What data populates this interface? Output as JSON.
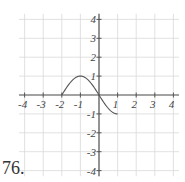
{
  "problem": {
    "number_label": "76."
  },
  "chart_data": {
    "type": "line",
    "title": "",
    "xlabel": "",
    "ylabel": "",
    "xlim": [
      -4,
      4
    ],
    "ylim": [
      -4,
      4
    ],
    "grid": true,
    "x_ticks": [
      -4,
      -3,
      -2,
      -1,
      1,
      2,
      3,
      4
    ],
    "y_ticks": [
      4,
      3,
      2,
      1,
      -1,
      -2,
      -3,
      -4
    ],
    "x_tick_labels": [
      "-4",
      "-3",
      "-2",
      "-1",
      "1",
      "2",
      "3",
      "4"
    ],
    "y_tick_labels": [
      "4",
      "3",
      "2",
      "1",
      "-1",
      "-2",
      "-3",
      "-4"
    ],
    "series": [
      {
        "name": "f(x)",
        "description": "Smooth sine-like curve from (-2,0) up to max (-1,1), through (0,0), down to (1,-1)",
        "x": [
          -2,
          -1.5,
          -1,
          -0.5,
          0,
          0.5,
          1
        ],
        "y": [
          0,
          0.71,
          1,
          0.71,
          0,
          -0.71,
          -1
        ],
        "color": "#555555"
      }
    ],
    "colors": {
      "grid": "#d9d9d9",
      "axis": "#555555",
      "curve": "#555555"
    }
  }
}
